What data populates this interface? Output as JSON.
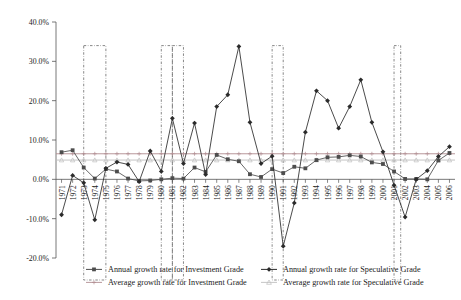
{
  "chart_data": {
    "type": "line",
    "title": "",
    "xlabel": "",
    "ylabel": "",
    "ylim": [
      -20,
      40
    ],
    "ytick_labels": [
      "40.0%",
      "30.0%",
      "20.0%",
      "10.0%",
      "0.0%",
      "-10.0%",
      "-20.0%"
    ],
    "ytick_values": [
      40,
      30,
      20,
      10,
      0,
      -10,
      -20
    ],
    "grid": false,
    "legend_position": "bottom",
    "categories": [
      "1971",
      "1972",
      "1973",
      "1974",
      "1975",
      "1976",
      "1977",
      "1978",
      "1979",
      "1980",
      "1981",
      "1982",
      "1983",
      "1984",
      "1985",
      "1986",
      "1987",
      "1988",
      "1989",
      "1990",
      "1991",
      "1992",
      "1993",
      "1994",
      "1995",
      "1996",
      "1997",
      "1998",
      "1999",
      "2000",
      "2001",
      "2002",
      "2003",
      "2004",
      "2005",
      "2006"
    ],
    "series": [
      {
        "name": "Annual growth rate for Investment Grade",
        "marker": "square",
        "color": "#4d4d4d",
        "values": [
          6.9,
          7.4,
          3.0,
          0.2,
          2.6,
          2.0,
          0.2,
          -0.4,
          -0.3,
          0.0,
          0.3,
          0.2,
          3.0,
          1.9,
          6.2,
          5.1,
          4.6,
          1.3,
          0.6,
          2.6,
          1.6,
          3.2,
          2.8,
          4.9,
          5.6,
          5.7,
          6.1,
          5.8,
          4.3,
          3.9,
          2.0,
          0.1,
          0.1,
          0.0,
          4.8,
          6.7
        ]
      },
      {
        "name": "Annual growth rate for Speculative Grade",
        "marker": "diamond",
        "color": "#2b2b2b",
        "values": [
          -9.0,
          1.0,
          -0.9,
          -10.3,
          2.8,
          4.4,
          3.8,
          -0.6,
          7.2,
          2.0,
          15.5,
          4.0,
          14.3,
          1.2,
          18.5,
          21.5,
          33.8,
          14.5,
          4.0,
          5.9,
          -17.0,
          -6.0,
          12.0,
          22.5,
          20.0,
          13.0,
          18.5,
          25.3,
          14.5,
          7.0,
          -1.5,
          -9.6,
          0.0,
          2.2,
          5.8,
          8.3
        ]
      },
      {
        "name": "Average growth rate for Investment Grade",
        "marker": "cross",
        "color": "#b08c90",
        "type": "average",
        "value": 6.5
      },
      {
        "name": "Average growth rate for Speculative Grade",
        "marker": "triangle",
        "color": "#bfbfbf",
        "type": "average",
        "value": 4.9
      }
    ],
    "recession_bands": [
      {
        "start": "1973",
        "end": "1975"
      },
      {
        "start": "1980",
        "end": "1981"
      },
      {
        "start": "1981",
        "end": "1982"
      },
      {
        "start": "1990",
        "end": "1991"
      },
      {
        "start": "2001",
        "end": "2001.6"
      }
    ],
    "band_top_value": 34.0
  },
  "legend": {
    "items": [
      {
        "label": "Annual growth rate for Investment Grade"
      },
      {
        "label": "Annual growth rate for Speculative Grade"
      },
      {
        "label": "Average growth rate for Investment Grade"
      },
      {
        "label": "Average growth rate for Speculative Grade"
      }
    ]
  }
}
